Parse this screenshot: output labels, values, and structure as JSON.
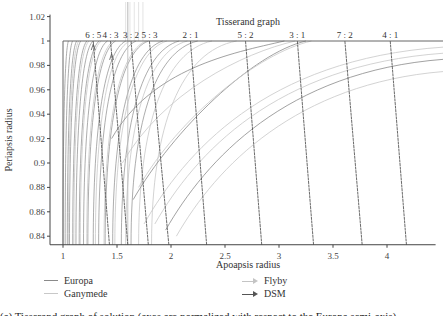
{
  "chart_data": {
    "type": "line",
    "title": "Tisserand graph",
    "xlabel": "Apoapsis radius",
    "ylabel": "Periapsis radius",
    "xlim": [
      1,
      4.45
    ],
    "ylim": [
      0.833,
      1.02
    ],
    "grid": false,
    "legend_position": "bottom",
    "x_ticks": [
      1,
      1.5,
      2,
      2.5,
      3,
      3.5,
      4
    ],
    "x_tick_labels": [
      "1",
      "1.5",
      "2",
      "2.5",
      "3",
      "3.5",
      "4"
    ],
    "y_ticks": [
      0.84,
      0.86,
      0.88,
      0.9,
      0.92,
      0.94,
      0.96,
      0.98,
      1,
      1.02
    ],
    "y_tick_labels": [
      "0.84",
      "0.86",
      "0.88",
      "0.9",
      "0.92",
      "0.94",
      "0.96",
      "0.98",
      "1",
      "1.02"
    ],
    "resonances": [
      {
        "label": "6 : 5",
        "x_top": 1.28,
        "x_bottom": 1.43
      },
      {
        "label": "4 : 3",
        "x_top": 1.44,
        "x_bottom": 1.6
      },
      {
        "label": "3 : 2",
        "x_top": 1.63,
        "x_bottom": 1.79
      },
      {
        "label": "5 : 3",
        "x_top": 1.8,
        "x_bottom": 1.98
      },
      {
        "label": "2 : 1",
        "x_top": 2.18,
        "x_bottom": 2.33
      },
      {
        "label": "5 : 2",
        "x_top": 2.69,
        "x_bottom": 2.84
      },
      {
        "label": "3 : 1",
        "x_top": 3.17,
        "x_bottom": 3.32
      },
      {
        "label": "7 : 2",
        "x_top": 3.61,
        "x_bottom": 3.77
      },
      {
        "label": "4 : 1",
        "x_top": 4.03,
        "x_bottom": 4.18
      }
    ],
    "series": [
      {
        "name": "Europa",
        "color": "#8a8a8a",
        "kind": "v-infinity contours"
      },
      {
        "name": "Ganymede",
        "color": "#c8c8c8",
        "kind": "v-infinity contours"
      },
      {
        "name": "Flyby",
        "color": "#c4c4c4",
        "kind": "arrow"
      },
      {
        "name": "DSM",
        "color": "#555555",
        "kind": "arrow"
      }
    ],
    "europa_contour_x_at_bottom": [
      1.0,
      1.02,
      1.04,
      1.06,
      1.09,
      1.12,
      1.15,
      1.19,
      1.23,
      1.28,
      1.33,
      1.39,
      1.46,
      1.54,
      1.63
    ],
    "ganymede_contour_x_at_bottom": [
      1.05,
      1.1,
      1.16,
      1.22,
      1.3,
      1.38,
      1.48,
      1.58,
      1.7,
      1.82
    ],
    "upper_contours": [
      {
        "series": "Europa",
        "y_at_right": 0.985
      },
      {
        "series": "Ganymede",
        "y_at_right": 0.975
      },
      {
        "series": "Ganymede",
        "y_at_right": 0.995
      }
    ]
  },
  "legend": {
    "europa": "Europa",
    "ganymede": "Ganymede",
    "flyby": "Flyby",
    "dsm": "DSM"
  },
  "caption": "(a) Tisserand graph of solution (axes are normalized with respect to the Europa semi-axis)"
}
